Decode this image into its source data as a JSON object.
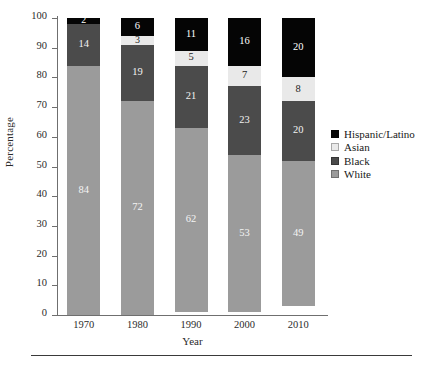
{
  "chart_data": {
    "type": "bar",
    "stacked": true,
    "title": "",
    "xlabel": "Year",
    "ylabel": "Percentage",
    "categories": [
      "1970",
      "1980",
      "1990",
      "2000",
      "2010"
    ],
    "ylim": [
      0,
      100
    ],
    "yticks": [
      "0",
      "10",
      "20",
      "30",
      "40",
      "50",
      "60",
      "70",
      "80",
      "90",
      "100"
    ],
    "grid": false,
    "legend_position": "right",
    "series": [
      {
        "name": "Hispanic/Latino",
        "color": "#050505",
        "values": [
          2,
          6,
          11,
          16,
          20
        ]
      },
      {
        "name": "Asian",
        "color": "#e9e9e9",
        "values": [
          0,
          3,
          5,
          7,
          8
        ]
      },
      {
        "name": "Black",
        "color": "#4b4b4b",
        "values": [
          14,
          19,
          21,
          23,
          20
        ]
      },
      {
        "name": "White",
        "color": "#9b9b9b",
        "values": [
          84,
          72,
          62,
          53,
          49
        ]
      }
    ],
    "stack_order_bottom_to_top": [
      "White",
      "Black",
      "Asian",
      "Hispanic/Latino"
    ],
    "bars": [
      {
        "category": "1970",
        "segments": [
          {
            "series": "Hispanic/Latino",
            "value": 2,
            "label": "2",
            "color": "#050505",
            "text_color": "#ffffff"
          },
          {
            "series": "Black",
            "value": 14,
            "label": "14",
            "color": "#4b4b4b",
            "text_color": "#f2f2f2"
          },
          {
            "series": "White",
            "value": 84,
            "label": "84",
            "color": "#9b9b9b",
            "text_color": "#f4f4f4"
          }
        ]
      },
      {
        "category": "1980",
        "segments": [
          {
            "series": "Hispanic/Latino",
            "value": 6,
            "label": "6",
            "color": "#050505",
            "text_color": "#ffffff"
          },
          {
            "series": "Asian",
            "value": 3,
            "label": "3",
            "color": "#e9e9e9",
            "text_color": "#1c1c1c"
          },
          {
            "series": "Black",
            "value": 19,
            "label": "19",
            "color": "#4b4b4b",
            "text_color": "#f2f2f2"
          },
          {
            "series": "White",
            "value": 72,
            "label": "72",
            "color": "#9b9b9b",
            "text_color": "#f4f4f4"
          }
        ]
      },
      {
        "category": "1990",
        "segments": [
          {
            "series": "Hispanic/Latino",
            "value": 11,
            "label": "11",
            "color": "#050505",
            "text_color": "#ffffff"
          },
          {
            "series": "Asian",
            "value": 5,
            "label": "5",
            "color": "#e9e9e9",
            "text_color": "#1c1c1c"
          },
          {
            "series": "Black",
            "value": 21,
            "label": "21",
            "color": "#4b4b4b",
            "text_color": "#f2f2f2"
          },
          {
            "series": "White",
            "value": 62,
            "label": "62",
            "color": "#9b9b9b",
            "text_color": "#f4f4f4"
          }
        ]
      },
      {
        "category": "2000",
        "segments": [
          {
            "series": "Hispanic/Latino",
            "value": 16,
            "label": "16",
            "color": "#050505",
            "text_color": "#ffffff"
          },
          {
            "series": "Asian",
            "value": 7,
            "label": "7",
            "color": "#e9e9e9",
            "text_color": "#1c1c1c"
          },
          {
            "series": "Black",
            "value": 23,
            "label": "23",
            "color": "#4b4b4b",
            "text_color": "#f2f2f2"
          },
          {
            "series": "White",
            "value": 53,
            "label": "53",
            "color": "#9b9b9b",
            "text_color": "#f4f4f4"
          }
        ]
      },
      {
        "category": "2010",
        "segments": [
          {
            "series": "Hispanic/Latino",
            "value": 20,
            "label": "20",
            "color": "#050505",
            "text_color": "#ffffff"
          },
          {
            "series": "Asian",
            "value": 8,
            "label": "8",
            "color": "#e9e9e9",
            "text_color": "#1c1c1c"
          },
          {
            "series": "Black",
            "value": 20,
            "label": "20",
            "color": "#4b4b4b",
            "text_color": "#f2f2f2"
          },
          {
            "series": "White",
            "value": 49,
            "label": "49",
            "color": "#9b9b9b",
            "text_color": "#f4f4f4"
          }
        ]
      }
    ]
  },
  "legend": {
    "entries": [
      {
        "label": "Hispanic/Latino",
        "color": "#050505"
      },
      {
        "label": "Asian",
        "color": "#e9e9e9"
      },
      {
        "label": "Black",
        "color": "#4b4b4b"
      },
      {
        "label": "White",
        "color": "#9b9b9b"
      }
    ]
  },
  "caption": {
    "text": ""
  }
}
